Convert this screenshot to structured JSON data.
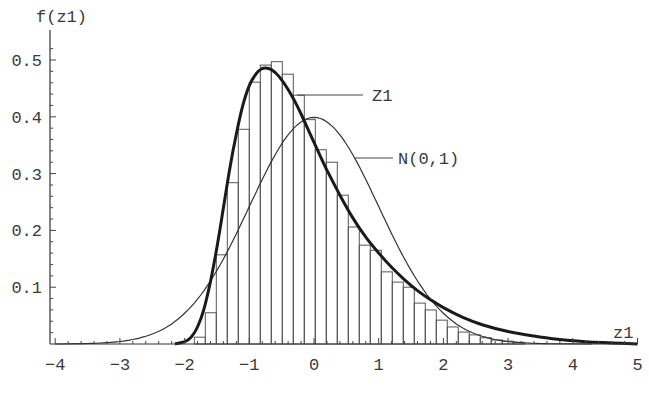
{
  "chart_data": {
    "type": "bar",
    "title": "",
    "xlabel": "z1",
    "ylabel": "f(z1)",
    "xlim": [
      -4.05,
      5
    ],
    "ylim": [
      0,
      0.55
    ],
    "grid": false,
    "x_ticks": [
      -4,
      -3,
      -2,
      -1,
      0,
      1,
      2,
      3,
      4,
      5
    ],
    "x_tick_labels": [
      "-4",
      "-3",
      "-2",
      "-1",
      "0",
      "1",
      "2",
      "3",
      "4",
      "5"
    ],
    "y_ticks": [
      0.1,
      0.2,
      0.3,
      0.4,
      0.5
    ],
    "y_tick_labels": [
      "0.1",
      "0.2",
      "0.3",
      "0.4",
      "0.5"
    ],
    "histogram": {
      "bin_start": -1.85,
      "bin_width": 0.17,
      "values": [
        0.012,
        0.055,
        0.157,
        0.284,
        0.378,
        0.461,
        0.491,
        0.497,
        0.475,
        0.438,
        0.395,
        0.342,
        0.32,
        0.262,
        0.206,
        0.174,
        0.165,
        0.127,
        0.109,
        0.1,
        0.072,
        0.06,
        0.042,
        0.03,
        0.021,
        0.016,
        0.011,
        0.007,
        0.005,
        0.003
      ]
    },
    "series": [
      {
        "name": "Z1",
        "type": "line",
        "style": "thick",
        "x": [
          -2.15,
          -2.0,
          -1.9,
          -1.8,
          -1.7,
          -1.6,
          -1.5,
          -1.4,
          -1.3,
          -1.2,
          -1.1,
          -1.0,
          -0.9,
          -0.8,
          -0.7,
          -0.6,
          -0.5,
          -0.4,
          -0.3,
          -0.2,
          -0.1,
          0.0,
          0.1,
          0.2,
          0.4,
          0.6,
          0.8,
          1.0,
          1.2,
          1.4,
          1.6,
          1.8,
          2.0,
          2.3,
          2.6,
          3.0,
          3.4,
          3.8,
          4.2,
          4.6,
          5.0
        ],
        "y": [
          0.0,
          0.004,
          0.012,
          0.03,
          0.062,
          0.11,
          0.17,
          0.24,
          0.31,
          0.37,
          0.42,
          0.455,
          0.475,
          0.485,
          0.485,
          0.478,
          0.465,
          0.448,
          0.428,
          0.405,
          0.38,
          0.355,
          0.33,
          0.306,
          0.262,
          0.222,
          0.188,
          0.16,
          0.135,
          0.113,
          0.094,
          0.078,
          0.064,
          0.047,
          0.034,
          0.022,
          0.014,
          0.008,
          0.004,
          0.002,
          0.0
        ]
      },
      {
        "name": "N(0,1)",
        "type": "line",
        "style": "thin",
        "mean": 0,
        "sd": 1,
        "x_range": [
          -3.6,
          3.6
        ]
      }
    ],
    "annotations": [
      {
        "text": "Z1",
        "points_to": "Z1 curve"
      },
      {
        "text": "N(0,1)",
        "points_to": "N(0,1) curve"
      }
    ],
    "legend_position": "inline labels with leader lines"
  }
}
